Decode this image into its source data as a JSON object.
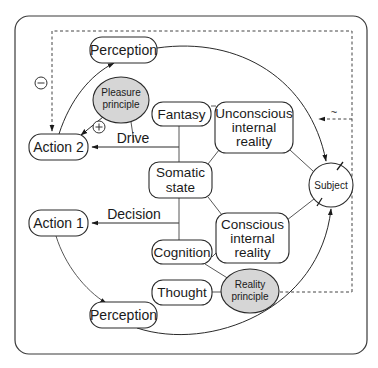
{
  "diagram": {
    "nodes": {
      "perception_top": "Perception",
      "pleasure_line1": "Pleasure",
      "pleasure_line2": "principle",
      "fantasy": "Fantasy",
      "unconscious_line1": "Unconscious",
      "unconscious_line2": "internal",
      "unconscious_line3": "reality",
      "action2": "Action 2",
      "somatic_line1": "Somatic",
      "somatic_line2": "state",
      "subject": "Subject",
      "action1": "Action 1",
      "conscious_line1": "Conscious",
      "conscious_line2": "internal",
      "conscious_line3": "reality",
      "cognition": "Cognition",
      "thought": "Thought",
      "reality_line1": "Reality",
      "reality_line2": "principle",
      "perception_bottom": "Perception"
    },
    "edge_labels": {
      "drive": "Drive",
      "decision": "Decision",
      "minus": "−",
      "plus": "+",
      "tilde": "~"
    },
    "colors": {
      "ellipse_fill": "#d6d6d6",
      "stroke": "#2a2a2a",
      "background": "#ffffff"
    }
  }
}
